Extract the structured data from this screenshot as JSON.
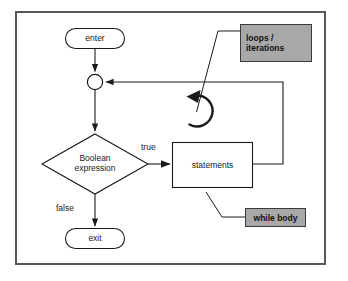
{
  "diagram": {
    "type": "flowchart",
    "colors": {
      "frame_border": "#58585a",
      "shape_stroke": "#1a1a1a",
      "shape_fill": "#ffffff",
      "callout_fill": "#a8a8a8",
      "callout_border": "#3b3b3b",
      "text": "#1a1a1a"
    },
    "nodes": [
      {
        "id": "enter",
        "shape": "stadium",
        "label": "enter"
      },
      {
        "id": "merge",
        "shape": "circle",
        "label": ""
      },
      {
        "id": "condition",
        "shape": "diamond",
        "label_line1": "Boolean",
        "label_line2": "expression"
      },
      {
        "id": "statements",
        "shape": "rectangle",
        "label": "statements"
      },
      {
        "id": "exit",
        "shape": "stadium",
        "label": "exit"
      }
    ],
    "edges": [
      {
        "from": "enter",
        "to": "merge",
        "label": ""
      },
      {
        "from": "merge",
        "to": "condition",
        "label": ""
      },
      {
        "from": "condition",
        "to": "statements",
        "label": "true"
      },
      {
        "from": "condition",
        "to": "exit",
        "label": "false"
      },
      {
        "from": "statements",
        "to": "merge",
        "label": ""
      }
    ],
    "callouts": [
      {
        "id": "loops-iterations",
        "line1": "loops /",
        "line2": "iterations",
        "points_to": "loop-symbol"
      },
      {
        "id": "while-body",
        "line1": "while body",
        "line2": "",
        "points_to": "statements"
      }
    ],
    "symbols": [
      {
        "id": "loop-symbol",
        "name": "circular-arrow-icon"
      }
    ]
  }
}
